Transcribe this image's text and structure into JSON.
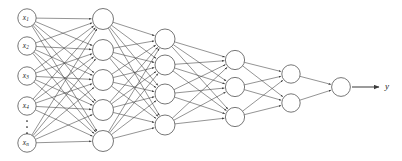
{
  "diagram": {
    "type": "neural-network-architecture",
    "background_color": "#ffffff",
    "edge_color": "#3a3a3a",
    "node_fill": "#ffffff",
    "node_stroke": "#4a4a4a",
    "layers": [
      {
        "id": "input-layer",
        "role": "input",
        "node_count": 5,
        "has_ellipsis": true,
        "cx": 27,
        "radius": 9.2,
        "nodes": [
          {
            "label": "x",
            "sub": "1",
            "cy": 18
          },
          {
            "label": "x",
            "sub": "2",
            "cy": 46
          },
          {
            "label": "x",
            "sub": "3",
            "cy": 76
          },
          {
            "label": "x",
            "sub": "4",
            "cy": 106
          },
          {
            "label": "x",
            "sub": "n",
            "cy": 143
          }
        ],
        "ellipsis": {
          "cx": 27,
          "y_positions": [
            121,
            127,
            133
          ]
        }
      },
      {
        "id": "hidden-layer-1",
        "role": "hidden",
        "node_count": 5,
        "has_ellipsis": false,
        "cx": 103,
        "radius": 10.5,
        "nodes": [
          {
            "label": "",
            "sub": "",
            "cy": 19
          },
          {
            "label": "",
            "sub": "",
            "cy": 50
          },
          {
            "label": "",
            "sub": "",
            "cy": 80
          },
          {
            "label": "",
            "sub": "",
            "cy": 110
          },
          {
            "label": "",
            "sub": "",
            "cy": 141
          }
        ]
      },
      {
        "id": "hidden-layer-2",
        "role": "hidden",
        "node_count": 4,
        "has_ellipsis": false,
        "cx": 165,
        "radius": 10.0,
        "nodes": [
          {
            "label": "",
            "sub": "",
            "cy": 39
          },
          {
            "label": "",
            "sub": "",
            "cy": 65
          },
          {
            "label": "",
            "sub": "",
            "cy": 94
          },
          {
            "label": "",
            "sub": "",
            "cy": 125
          }
        ]
      },
      {
        "id": "hidden-layer-3",
        "role": "hidden",
        "node_count": 3,
        "has_ellipsis": false,
        "cx": 235,
        "radius": 9.6,
        "nodes": [
          {
            "label": "",
            "sub": "",
            "cy": 60
          },
          {
            "label": "",
            "sub": "",
            "cy": 87
          },
          {
            "label": "",
            "sub": "",
            "cy": 117
          }
        ]
      },
      {
        "id": "hidden-layer-4",
        "role": "hidden",
        "node_count": 2,
        "has_ellipsis": false,
        "cx": 291,
        "radius": 9.2,
        "nodes": [
          {
            "label": "",
            "sub": "",
            "cy": 74
          },
          {
            "label": "",
            "sub": "",
            "cy": 103
          }
        ]
      },
      {
        "id": "output-layer",
        "role": "output",
        "node_count": 1,
        "has_ellipsis": false,
        "cx": 341,
        "radius": 9.4,
        "nodes": [
          {
            "label": "",
            "sub": "",
            "cy": 87
          }
        ]
      }
    ],
    "output_arrow": {
      "from_x": 352,
      "to_x": 379,
      "y": 87,
      "label": "y"
    }
  }
}
